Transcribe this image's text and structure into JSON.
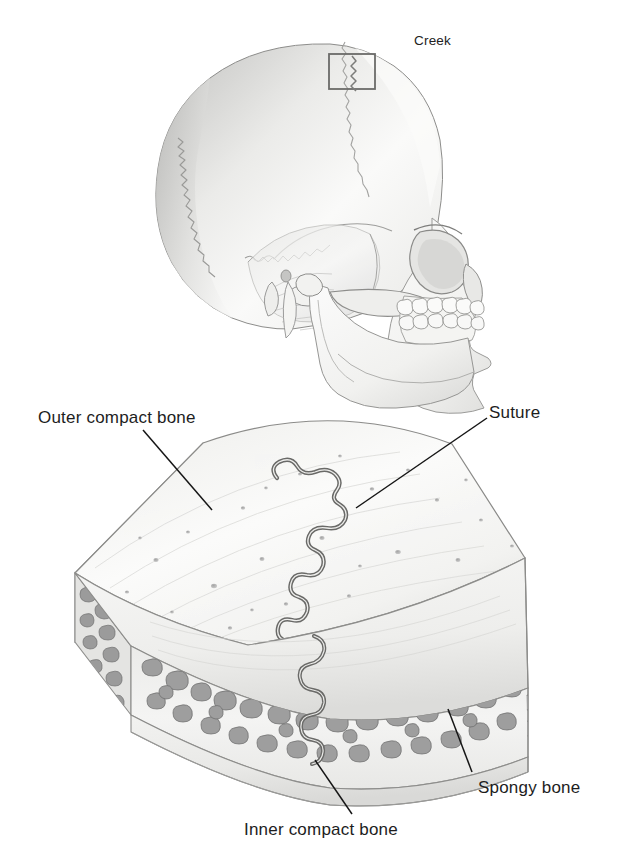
{
  "figure": {
    "background_color": "#ffffff",
    "ink_color": "#1d1d1d",
    "medium": "pencil-drawing-grayscale"
  },
  "signature": {
    "name": "signature-creek",
    "text": "Creek"
  },
  "panels": {
    "top": {
      "name": "skull-lateral-view",
      "subject": "human skull, left lateral view, facing right",
      "callout_box": {
        "name": "suture-callout-box",
        "label": "",
        "x": 329,
        "y": 54,
        "width": 46,
        "height": 35,
        "encloses": "coronal suture"
      }
    },
    "bottom": {
      "name": "flat-bone-block-diagram",
      "subject": "cut block of cranial flat bone showing suture and three layers"
    }
  },
  "labels": [
    {
      "id": "outer-compact",
      "text": "Outer compact bone",
      "text_x": 38,
      "text_y": 409,
      "leader": {
        "x1": 143,
        "y1": 430,
        "x2": 212,
        "y2": 510
      }
    },
    {
      "id": "suture",
      "text": "Suture",
      "text_x": 489,
      "text_y": 404,
      "leader": {
        "x1": 487,
        "y1": 418,
        "x2": 356,
        "y2": 508
      }
    },
    {
      "id": "spongy",
      "text": "Spongy bone",
      "text_x": 478,
      "text_y": 779,
      "leader": {
        "x1": 472,
        "y1": 772,
        "x2": 448,
        "y2": 709
      }
    },
    {
      "id": "inner-compact",
      "text": "Inner compact bone",
      "text_x": 244,
      "text_y": 821,
      "leader": {
        "x1": 352,
        "y1": 814,
        "x2": 315,
        "y2": 760
      }
    }
  ],
  "anatomy_terms": [
    "Outer compact bone",
    "Suture",
    "Spongy bone",
    "Inner compact bone"
  ],
  "colors": {
    "outline": "#6e6e6e",
    "outline_dark": "#4a4a4a",
    "suture_line": "#5d5d5d",
    "compact_fill": "#f4f4f2",
    "compact_shade": "#e3e3e1",
    "spongy_fill": "#ededeb",
    "trabecula": "#9a9a9a",
    "skull_fill": "#f7f7f6",
    "skull_shade": "#d8d8d6",
    "leader_line": "#161616",
    "text": "#1d1d1d"
  }
}
